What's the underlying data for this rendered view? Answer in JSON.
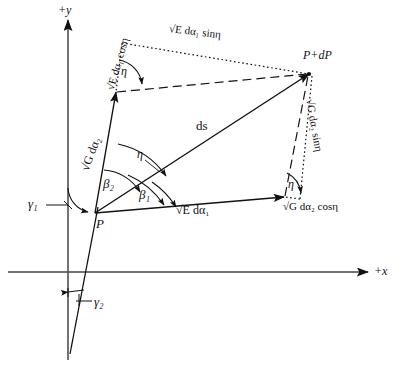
{
  "figure": {
    "type": "geometry-diagram"
  },
  "axes": {
    "y_label": "+y",
    "x_label": "+x"
  },
  "points": {
    "origin_point": "P",
    "displaced_point": "P+dP"
  },
  "vectors": {
    "e_dalpha1": "√E dα₁",
    "g_dalpha2": "√G dα₂",
    "ds": "ds",
    "e_dalpha1_cos": "√E dα₁ cosη",
    "e_dalpha1_sin": "√E dα₁ sinη",
    "g_dalpha2_sin": "√G dα₂ sinη",
    "g_dalpha2_cos": "√G dα₂ cosη"
  },
  "angles": {
    "eta_center": "η",
    "eta_topleft": "η",
    "eta_right": "η",
    "beta1": "β₁",
    "beta2": "β₂",
    "gamma1": "γ₁",
    "gamma2": "γ₂"
  }
}
